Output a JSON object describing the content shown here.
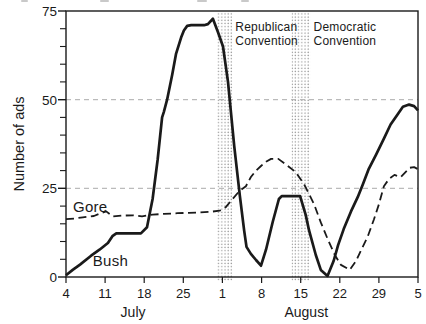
{
  "chart_data": {
    "type": "line",
    "title": "",
    "ylabel": "Number of ads",
    "ylim": [
      0,
      75
    ],
    "y_ticks": [
      0,
      25,
      50,
      75
    ],
    "y_minor_step": 5,
    "gridlines_y": [
      25,
      50
    ],
    "grid": "dashed horizontal gridlines at 25 and 50",
    "x_range": [
      0,
      63
    ],
    "x_unit": "days from July 4 to September 5",
    "x_tick_days": [
      0,
      7,
      14,
      21,
      28,
      35,
      42,
      49,
      56,
      63
    ],
    "x_tick_labels": [
      "4",
      "11",
      "18",
      "25",
      "1",
      "8",
      "15",
      "22",
      "29",
      "5"
    ],
    "month_labels": [
      {
        "label": "July",
        "center_day": 12
      },
      {
        "label": "August",
        "center_day": 43
      }
    ],
    "legend_position": "inline labels next to lines",
    "colors": {
      "line": "#1a1a1a",
      "gridline": "#ababab",
      "stipple": "#8f8f8f"
    },
    "bands": [
      {
        "id": "republican",
        "label": "Republican Convention",
        "start_day": 27.0,
        "end_day": 29.8,
        "label_day": 30.3
      },
      {
        "id": "democratic",
        "label": "Democratic Convention",
        "start_day": 40.4,
        "end_day": 43.7,
        "label_day": 44.3
      }
    ],
    "series": [
      {
        "name": "Bush",
        "style": "solid",
        "label_anchor": {
          "day": 4.8,
          "value": 7.0
        },
        "points": [
          [
            0,
            0.5
          ],
          [
            1.2,
            2
          ],
          [
            2.5,
            3.5
          ],
          [
            4.5,
            6
          ],
          [
            6,
            7.7
          ],
          [
            7.5,
            9.6
          ],
          [
            8.3,
            11.5
          ],
          [
            9,
            12.3
          ],
          [
            13.4,
            12.3
          ],
          [
            14.5,
            14
          ],
          [
            15.5,
            22
          ],
          [
            16.4,
            33
          ],
          [
            17.2,
            45
          ],
          [
            17.5,
            46.5
          ],
          [
            18.1,
            50
          ],
          [
            19,
            57
          ],
          [
            19.7,
            63
          ],
          [
            20.6,
            67.5
          ],
          [
            21.1,
            69.5
          ],
          [
            21.7,
            70.8
          ],
          [
            22.4,
            71
          ],
          [
            24.7,
            71
          ],
          [
            25.4,
            71.3
          ],
          [
            26.3,
            72.8
          ],
          [
            27.2,
            69
          ],
          [
            28.1,
            65
          ],
          [
            29,
            55
          ],
          [
            30.1,
            37
          ],
          [
            31.1,
            23
          ],
          [
            31.9,
            13
          ],
          [
            32.3,
            8.5
          ],
          [
            33.1,
            6.5
          ],
          [
            34,
            4.8
          ],
          [
            34.9,
            3.2
          ],
          [
            35.8,
            7.7
          ],
          [
            37,
            15.5
          ],
          [
            38.1,
            22
          ],
          [
            38.6,
            22.8
          ],
          [
            41.9,
            22.8
          ],
          [
            42.9,
            17.5
          ],
          [
            43.5,
            13.2
          ],
          [
            44.7,
            6.2
          ],
          [
            45.6,
            2
          ],
          [
            46.8,
            0.3
          ],
          [
            47.9,
            4.5
          ],
          [
            48.7,
            9
          ],
          [
            49.7,
            13.5
          ],
          [
            51,
            18.5
          ],
          [
            52.2,
            22.5
          ],
          [
            53.1,
            26
          ],
          [
            54.2,
            30.5
          ],
          [
            55.5,
            34.5
          ],
          [
            56.9,
            39
          ],
          [
            58.1,
            43
          ],
          [
            59.4,
            46
          ],
          [
            60.3,
            48
          ],
          [
            61.4,
            48.6
          ],
          [
            62.3,
            48.2
          ],
          [
            63,
            47
          ]
        ]
      },
      {
        "name": "Gore",
        "style": "dashed",
        "label_anchor": {
          "day": 1.25,
          "value": 22.3
        },
        "points": [
          [
            0,
            16.3
          ],
          [
            1.5,
            16.5
          ],
          [
            3,
            16.8
          ],
          [
            5,
            17.2
          ],
          [
            6.2,
            18
          ],
          [
            7.2,
            18.5
          ],
          [
            8.4,
            17.1
          ],
          [
            10,
            17.3
          ],
          [
            12,
            17.4
          ],
          [
            13.6,
            17.1
          ],
          [
            15.5,
            17.6
          ],
          [
            17.5,
            17.8
          ],
          [
            20,
            18
          ],
          [
            22,
            18.1
          ],
          [
            24,
            18.2
          ],
          [
            26,
            18.4
          ],
          [
            27.5,
            18.7
          ],
          [
            28.6,
            19.7
          ],
          [
            29.5,
            21.4
          ],
          [
            31,
            24.2
          ],
          [
            32.2,
            25.6
          ],
          [
            33.1,
            28.2
          ],
          [
            34,
            30
          ],
          [
            34.9,
            31.3
          ],
          [
            35.8,
            32.5
          ],
          [
            36.7,
            33.3
          ],
          [
            38,
            33.3
          ],
          [
            39.7,
            31.3
          ],
          [
            41.1,
            29.6
          ],
          [
            42.6,
            26.2
          ],
          [
            43.5,
            23.4
          ],
          [
            44.4,
            20.5
          ],
          [
            45.6,
            15.4
          ],
          [
            46.9,
            10.5
          ],
          [
            48.1,
            6.3
          ],
          [
            49.2,
            3.4
          ],
          [
            50.8,
            2
          ],
          [
            51.9,
            4.5
          ],
          [
            52.8,
            7.5
          ],
          [
            54,
            11.4
          ],
          [
            55.1,
            16.2
          ],
          [
            56,
            20.5
          ],
          [
            56.9,
            25.6
          ],
          [
            57.8,
            27.6
          ],
          [
            58.8,
            28.8
          ],
          [
            59.9,
            28.2
          ],
          [
            61.5,
            30.8
          ],
          [
            62.3,
            31
          ],
          [
            63,
            30.4
          ]
        ]
      }
    ]
  }
}
